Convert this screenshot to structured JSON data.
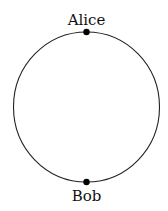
{
  "diagram": {
    "shape": "circle",
    "nodes": [
      {
        "label": "Alice",
        "position": "top"
      },
      {
        "label": "Bob",
        "position": "bottom"
      }
    ],
    "stroke_color": "#222222",
    "node_color": "#000000"
  }
}
